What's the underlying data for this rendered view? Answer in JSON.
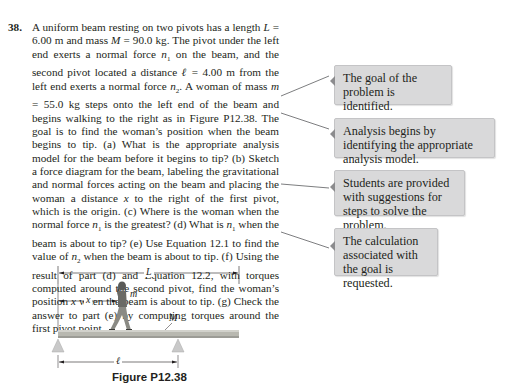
{
  "problem": {
    "number": "38.",
    "segments": [
      {
        "t": "A uniform beam resting on two pivots has a length "
      },
      {
        "i": "L"
      },
      {
        "t": " = 6.00 m and mass "
      },
      {
        "i": "M"
      },
      {
        "t": " = 90.0 kg. The pivot under the left end exerts a normal force "
      },
      {
        "i": "n",
        "sub": "1"
      },
      {
        "t": " on the beam, and the second pivot located a distance "
      },
      {
        "i": "ℓ"
      },
      {
        "t": " = 4.00 m from the left end exerts a normal force "
      },
      {
        "i": "n",
        "sub": "2"
      },
      {
        "t": ". A woman of mass "
      },
      {
        "i": "m"
      },
      {
        "t": " = 55.0 kg steps onto the left end of the beam and begins walking to the right as in Figure P12.38. The goal is to find the woman’s position when the beam begins to tip. (a) What is the appropriate analysis model for the beam before it begins to tip? (b) Sketch a force diagram for the beam, labeling the gravitational and normal forces acting on the beam and placing the woman a distance "
      },
      {
        "i": "x"
      },
      {
        "t": " to the right of the first pivot, which is the origin. (c) Where is the woman when the normal force "
      },
      {
        "i": "n",
        "sub": "1"
      },
      {
        "t": " is the greatest? (d) What is "
      },
      {
        "i": "n",
        "sub": "1"
      },
      {
        "t": " when the beam is about to tip? (e) Use Equation 12.1 to find the value of "
      },
      {
        "i": "n",
        "sub": "2"
      },
      {
        "t": " when the beam is about to tip. (f) Using the result of part (d) and Equation 12.2, with torques computed around the second pivot, find the woman’s position "
      },
      {
        "i": "x"
      },
      {
        "t": " when the beam is about to tip. (g) Check the answer to part (e) by computing torques around the first pivot point."
      }
    ]
  },
  "callouts": [
    {
      "text": "The goal of the problem is identified."
    },
    {
      "text": "Analysis begins by identifying the appropriate analysis model."
    },
    {
      "text": "Students are provided with suggestions for steps to solve the problem."
    },
    {
      "text": "The calculation associated with the goal is requested."
    }
  ],
  "figure": {
    "labels": {
      "L": "L",
      "x": "x",
      "m": "m",
      "M": "M",
      "ell": "ℓ"
    },
    "caption": "Figure P12.38"
  },
  "colors": {
    "callout_bg": "#d9d9da",
    "connector": "#6d6e71",
    "beam": "#b8b8b0",
    "pivot": "#c9c9c9",
    "text": "#231f20"
  }
}
